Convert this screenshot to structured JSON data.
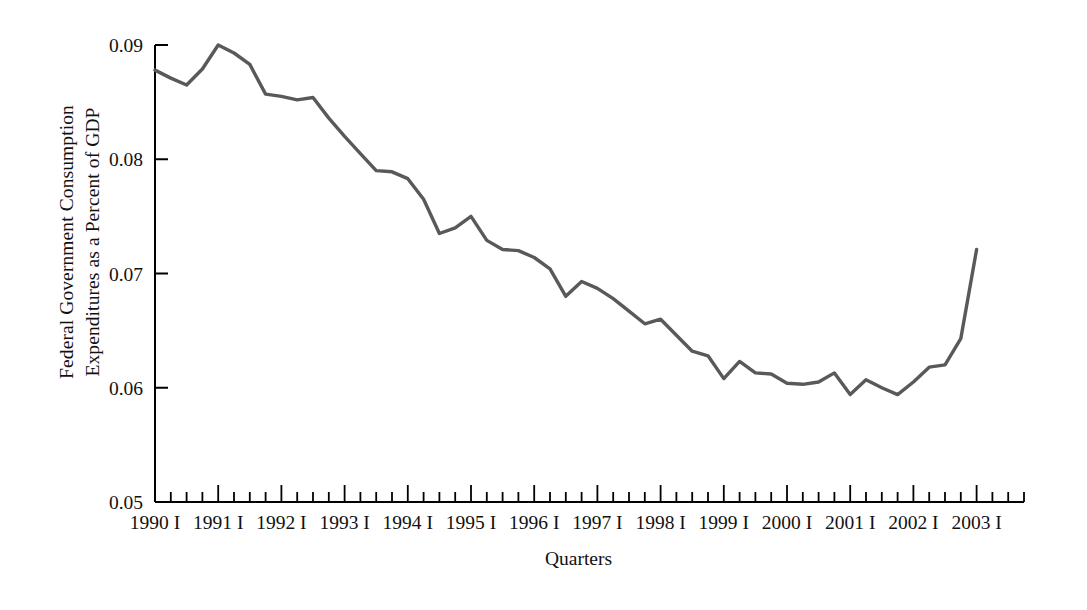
{
  "chart_data": {
    "type": "line",
    "title": "",
    "xlabel": "Quarters",
    "ylabel": "Federal Government Consumption Expenditures as a Percent of GDP",
    "ylabel_line1": "Federal Government Consumption",
    "ylabel_line2": "Expenditures as a Percent of GDP",
    "ylim": [
      0.05,
      0.09
    ],
    "yticks": [
      0.05,
      0.06,
      0.07,
      0.08,
      0.09
    ],
    "ytick_labels": [
      "0.05",
      "0.06",
      "0.07",
      "0.08",
      "0.09"
    ],
    "xtick_labels": [
      "1990 I",
      "1991 I",
      "1992 I",
      "1993 I",
      "1994 I",
      "1995 I",
      "1996 I",
      "1997 I",
      "1998 I",
      "1999 I",
      "2000 I",
      "2001 I",
      "2002 I",
      "2003 I"
    ],
    "x_start_label": "1990 I",
    "x_end_label": "2003 I",
    "minor_ticks_per_label": 4,
    "grid": false,
    "legend": false,
    "line_color": "#595959",
    "axis_color": "#000000",
    "background": "#ffffff",
    "series": [
      {
        "name": "Federal Government Consumption Expenditures as a Percent of GDP",
        "x": [
          "1990 I",
          "1990 II",
          "1990 III",
          "1990 IV",
          "1991 I",
          "1991 II",
          "1991 III",
          "1991 IV",
          "1992 I",
          "1992 II",
          "1992 III",
          "1992 IV",
          "1993 I",
          "1993 II",
          "1993 III",
          "1993 IV",
          "1994 I",
          "1994 II",
          "1994 III",
          "1994 IV",
          "1995 I",
          "1995 II",
          "1995 III",
          "1995 IV",
          "1996 I",
          "1996 II",
          "1996 III",
          "1996 IV",
          "1997 I",
          "1997 II",
          "1997 III",
          "1997 IV",
          "1998 I",
          "1998 II",
          "1998 III",
          "1998 IV",
          "1999 I",
          "1999 II",
          "1999 III",
          "1999 IV",
          "2000 I",
          "2000 II",
          "2000 III",
          "2000 IV",
          "2001 I",
          "2001 II",
          "2001 III",
          "2001 IV",
          "2002 I",
          "2002 II",
          "2002 III",
          "2002 IV",
          "2003 I"
        ],
        "values": [
          0.0878,
          0.0871,
          0.0865,
          0.0879,
          0.09,
          0.0893,
          0.0883,
          0.0857,
          0.0855,
          0.0852,
          0.0854,
          0.0836,
          0.082,
          0.0805,
          0.079,
          0.0789,
          0.0783,
          0.0765,
          0.0735,
          0.074,
          0.075,
          0.0729,
          0.0721,
          0.072,
          0.0714,
          0.0704,
          0.068,
          0.0693,
          0.0687,
          0.0678,
          0.0667,
          0.0656,
          0.066,
          0.0646,
          0.0632,
          0.0628,
          0.0608,
          0.0623,
          0.0613,
          0.0612,
          0.0604,
          0.0603,
          0.0605,
          0.0613,
          0.0594,
          0.0607,
          0.06,
          0.0594,
          0.0605,
          0.0618,
          0.062,
          0.0643,
          0.0721
        ]
      }
    ]
  }
}
